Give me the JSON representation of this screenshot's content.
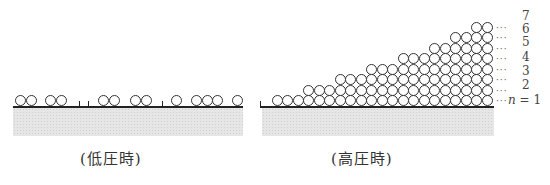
{
  "low_pressure": {
    "caption": "(低圧時)",
    "circle_x": [
      15,
      25.5,
      45,
      55.5,
      98,
      108.5,
      130,
      140.5,
      171,
      191,
      201.5,
      212,
      232
    ],
    "tick_x": [
      79,
      88,
      162
    ]
  },
  "high_pressure": {
    "caption": "(高圧時)",
    "layers": [
      {
        "n": "1",
        "count": 21,
        "label": "n = 1"
      },
      {
        "n": "2",
        "count": 18,
        "label": "2"
      },
      {
        "n": "3",
        "count": 15,
        "label": "3"
      },
      {
        "n": "4",
        "count": 12,
        "label": "4"
      },
      {
        "n": "5",
        "count": 9,
        "label": "5"
      },
      {
        "n": "6",
        "count": 6,
        "label": "6"
      },
      {
        "n": "7",
        "count": 4,
        "label": "7"
      },
      {
        "n": "8",
        "count": 2,
        "label": ""
      }
    ],
    "dots": "…",
    "n_label_prefix": "n",
    "n_label_suffix": "= 1"
  },
  "labels": {
    "l7": "7",
    "l6": "6",
    "l5": "5",
    "l4": "4",
    "l3": "3",
    "l2": "2",
    "l1": "1"
  }
}
